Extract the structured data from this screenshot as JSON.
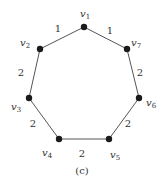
{
  "diagram": {
    "type": "weighted-cycle-graph",
    "caption": "(c)",
    "nodes": [
      {
        "id": "v1",
        "base": "v",
        "sub": "1",
        "x": 84,
        "y": 27,
        "lx": 80,
        "ly": 17
      },
      {
        "id": "v2",
        "base": "v",
        "sub": "2",
        "x": 40,
        "y": 49,
        "lx": 20,
        "ly": 46
      },
      {
        "id": "v3",
        "base": "v",
        "sub": "3",
        "x": 29,
        "y": 98,
        "lx": 11,
        "ly": 110
      },
      {
        "id": "v4",
        "base": "v",
        "sub": "4",
        "x": 59,
        "y": 139,
        "lx": 42,
        "ly": 156
      },
      {
        "id": "v5",
        "base": "v",
        "sub": "5",
        "x": 109,
        "y": 139,
        "lx": 110,
        "ly": 158
      },
      {
        "id": "v6",
        "base": "v",
        "sub": "6",
        "x": 139,
        "y": 98,
        "lx": 146,
        "ly": 106
      },
      {
        "id": "v7",
        "base": "v",
        "sub": "7",
        "x": 127,
        "y": 49,
        "lx": 131,
        "ly": 46
      }
    ],
    "edges": [
      {
        "from": "v1",
        "to": "v2",
        "weight": "1",
        "lx": 58,
        "ly": 32
      },
      {
        "from": "v1",
        "to": "v7",
        "weight": "1",
        "lx": 110,
        "ly": 34
      },
      {
        "from": "v2",
        "to": "v3",
        "weight": "2",
        "lx": 21,
        "ly": 76
      },
      {
        "from": "v7",
        "to": "v6",
        "weight": "2",
        "lx": 140,
        "ly": 76
      },
      {
        "from": "v3",
        "to": "v4",
        "weight": "2",
        "lx": 33,
        "ly": 127
      },
      {
        "from": "v6",
        "to": "v5",
        "weight": "2",
        "lx": 128,
        "ly": 127
      },
      {
        "from": "v4",
        "to": "v5",
        "weight": "2",
        "lx": 82,
        "ly": 157
      }
    ]
  }
}
